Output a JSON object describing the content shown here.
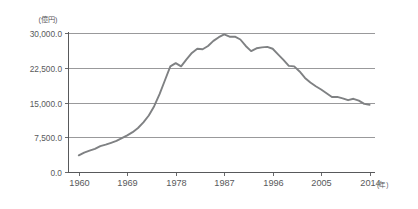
{
  "chart_data": {
    "type": "line",
    "title": "",
    "subtitle": "",
    "xlabel": "(年)",
    "ylabel": "(億円)",
    "y_unit_label": "(億円)",
    "x_unit_label": "(年)",
    "xlim": [
      1958,
      2015
    ],
    "ylim": [
      0,
      30000
    ],
    "grid": true,
    "legend": "none",
    "y_ticks": [
      0,
      7500,
      15000,
      22500,
      30000
    ],
    "y_tick_labels": [
      "0.0",
      "7,500.0",
      "15,000.0",
      "22,500.0",
      "30,000.0"
    ],
    "x_ticks": [
      1960,
      1969,
      1978,
      1987,
      1996,
      2005,
      2014
    ],
    "x_tick_labels": [
      "1960",
      "1969",
      "1978",
      "1987",
      "1996",
      "2005",
      "2014"
    ],
    "series": [
      {
        "name": "金額",
        "color": "#7f8183",
        "x": [
          1960,
          1961,
          1962,
          1963,
          1964,
          1965,
          1966,
          1967,
          1968,
          1969,
          1970,
          1971,
          1972,
          1973,
          1974,
          1975,
          1976,
          1977,
          1978,
          1979,
          1980,
          1981,
          1982,
          1983,
          1984,
          1985,
          1986,
          1987,
          1988,
          1989,
          1990,
          1991,
          1992,
          1993,
          1994,
          1995,
          1996,
          1997,
          1998,
          1999,
          2000,
          2001,
          2002,
          2003,
          2004,
          2005,
          2006,
          2007,
          2008,
          2009,
          2010,
          2011,
          2012,
          2013,
          2014
        ],
        "values": [
          3600,
          4200,
          4600,
          5000,
          5600,
          5900,
          6300,
          6700,
          7300,
          7900,
          8600,
          9500,
          10700,
          12200,
          14200,
          16800,
          19800,
          22800,
          23500,
          22800,
          24300,
          25700,
          26600,
          26500,
          27200,
          28300,
          29100,
          29700,
          29200,
          29200,
          28600,
          27200,
          26100,
          26700,
          26900,
          27000,
          26600,
          25400,
          24200,
          22900,
          22800,
          21700,
          20300,
          19300,
          18500,
          17800,
          17000,
          16200,
          16200,
          15900,
          15500,
          15800,
          15400,
          14700,
          14500
        ]
      }
    ]
  },
  "axes": {
    "y_unit": "(億円)",
    "x_unit": "(年)"
  }
}
